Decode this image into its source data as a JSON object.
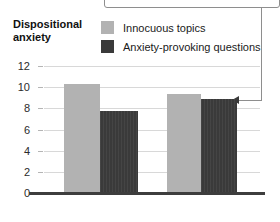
{
  "chart_data": {
    "type": "bar",
    "title": "",
    "xlabel": "",
    "ylabel": "Dispositional anxiety",
    "ylim": [
      0,
      12
    ],
    "yticks": [
      0,
      2,
      4,
      6,
      8,
      10,
      12
    ],
    "grid": true,
    "legend_position": "top-center",
    "categories": [
      "Not busy",
      "Busy"
    ],
    "series": [
      {
        "name": "Innocuous topics",
        "color": "#b2b2b2",
        "values": [
          10.3,
          9.35
        ]
      },
      {
        "name": "Anxiety-provoking questions",
        "color": "#3a3a3a",
        "values": [
          7.75,
          8.9
        ]
      }
    ],
    "annotations": [
      {
        "name": "callout-pointer",
        "text": "",
        "points_to": {
          "category": "Busy",
          "series": "Anxiety-provoking questions"
        }
      }
    ]
  },
  "axis": {
    "y_title_line1": "Dispositional",
    "y_title_line2": "anxiety",
    "tick_labels": [
      "12",
      "10",
      "8",
      "6",
      "4",
      "2",
      "0"
    ]
  },
  "legend": {
    "items": [
      {
        "label": "Innocuous topics",
        "color": "#b2b2b2"
      },
      {
        "label": "Anxiety-provoking questions",
        "color": "#3a3a3a"
      }
    ]
  },
  "category_labels": [
    "Not busy",
    "Busy"
  ]
}
